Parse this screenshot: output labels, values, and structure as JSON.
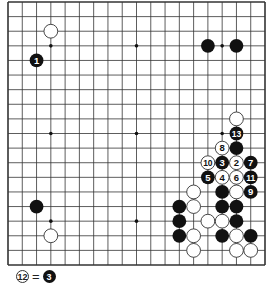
{
  "board": {
    "size": 19,
    "line_color": "#333333",
    "star_points": [
      [
        3,
        3
      ],
      [
        9,
        3
      ],
      [
        15,
        3
      ],
      [
        3,
        9
      ],
      [
        9,
        9
      ],
      [
        15,
        9
      ],
      [
        3,
        15
      ],
      [
        9,
        15
      ],
      [
        15,
        15
      ]
    ],
    "stones": [
      {
        "color": "white",
        "col": 3,
        "row": 2,
        "label": ""
      },
      {
        "color": "black",
        "col": 2,
        "row": 4,
        "label": "1"
      },
      {
        "color": "black",
        "col": 14,
        "row": 3,
        "label": ""
      },
      {
        "color": "black",
        "col": 16,
        "row": 3,
        "label": ""
      },
      {
        "color": "black",
        "col": 2,
        "row": 14,
        "label": ""
      },
      {
        "color": "white",
        "col": 3,
        "row": 16,
        "label": ""
      },
      {
        "color": "white",
        "col": 16,
        "row": 8,
        "label": ""
      },
      {
        "color": "black",
        "col": 16,
        "row": 9,
        "label": "13"
      },
      {
        "color": "white",
        "col": 15,
        "row": 10,
        "label": "8"
      },
      {
        "color": "black",
        "col": 16,
        "row": 10,
        "label": ""
      },
      {
        "color": "white",
        "col": 14,
        "row": 11,
        "label": "10"
      },
      {
        "color": "black",
        "col": 15,
        "row": 11,
        "label": "3"
      },
      {
        "color": "white",
        "col": 16,
        "row": 11,
        "label": "2"
      },
      {
        "color": "black",
        "col": 17,
        "row": 11,
        "label": "7"
      },
      {
        "color": "black",
        "col": 14,
        "row": 12,
        "label": "5"
      },
      {
        "color": "white",
        "col": 15,
        "row": 12,
        "label": "4"
      },
      {
        "color": "white",
        "col": 16,
        "row": 12,
        "label": "6"
      },
      {
        "color": "black",
        "col": 17,
        "row": 12,
        "label": "11"
      },
      {
        "color": "white",
        "col": 13,
        "row": 13,
        "label": ""
      },
      {
        "color": "black",
        "col": 15,
        "row": 13,
        "label": ""
      },
      {
        "color": "white",
        "col": 16,
        "row": 13,
        "label": ""
      },
      {
        "color": "black",
        "col": 17,
        "row": 13,
        "label": "9"
      },
      {
        "color": "black",
        "col": 12,
        "row": 14,
        "label": ""
      },
      {
        "color": "white",
        "col": 13,
        "row": 14,
        "label": ""
      },
      {
        "color": "black",
        "col": 15,
        "row": 14,
        "label": ""
      },
      {
        "color": "black",
        "col": 16,
        "row": 14,
        "label": ""
      },
      {
        "color": "black",
        "col": 12,
        "row": 15,
        "label": ""
      },
      {
        "color": "white",
        "col": 14,
        "row": 15,
        "label": ""
      },
      {
        "color": "white",
        "col": 15,
        "row": 15,
        "label": ""
      },
      {
        "color": "black",
        "col": 16,
        "row": 15,
        "label": ""
      },
      {
        "color": "black",
        "col": 12,
        "row": 16,
        "label": ""
      },
      {
        "color": "white",
        "col": 13,
        "row": 16,
        "label": ""
      },
      {
        "color": "black",
        "col": 15,
        "row": 16,
        "label": ""
      },
      {
        "color": "white",
        "col": 16,
        "row": 16,
        "label": ""
      },
      {
        "color": "black",
        "col": 17,
        "row": 16,
        "label": ""
      },
      {
        "color": "white",
        "col": 13,
        "row": 17,
        "label": ""
      },
      {
        "color": "white",
        "col": 16,
        "row": 17,
        "label": ""
      },
      {
        "color": "white",
        "col": 17,
        "row": 17,
        "label": ""
      }
    ]
  },
  "caption": {
    "left_stone": {
      "color": "white",
      "label": "12"
    },
    "equals": "=",
    "right_stone": {
      "color": "black",
      "label": "3"
    }
  }
}
